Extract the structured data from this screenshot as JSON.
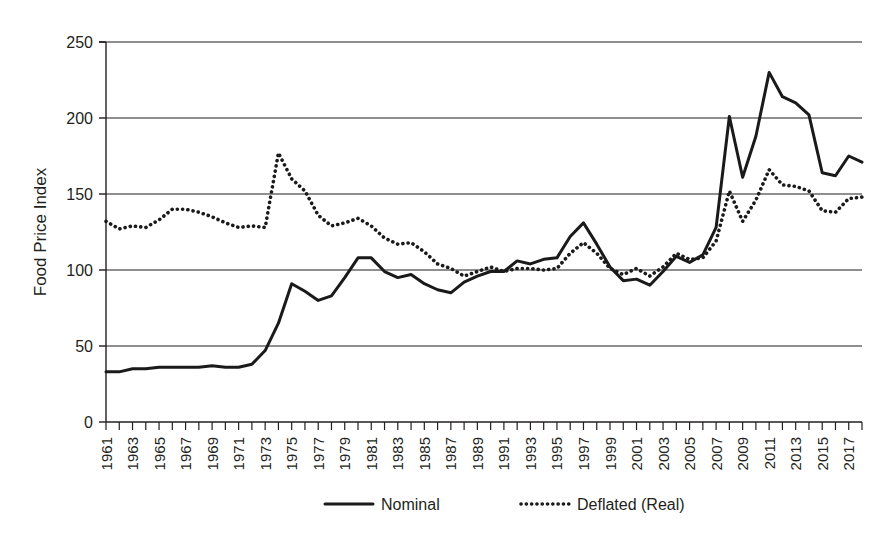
{
  "chart_data": {
    "type": "line",
    "title": "",
    "xlabel": "",
    "ylabel": "Food Price Index",
    "ylim": [
      0,
      250
    ],
    "ytick_step": 50,
    "yticks": [
      "0",
      "50",
      "100",
      "150",
      "200",
      "250"
    ],
    "xlim": [
      1961,
      2018
    ],
    "xtick_step": 1,
    "xtick_label_step": 2,
    "xticks": [
      "1961",
      "1963",
      "1965",
      "1967",
      "1969",
      "1971",
      "1973",
      "1975",
      "1977",
      "1979",
      "1981",
      "1983",
      "1985",
      "1987",
      "1989",
      "1991",
      "1993",
      "1995",
      "1997",
      "1999",
      "2001",
      "2003",
      "2005",
      "2007",
      "2009",
      "2011",
      "2013",
      "2015",
      "2017"
    ],
    "grid": "horizontal",
    "legend_position": "bottom-center",
    "x": [
      1961,
      1962,
      1963,
      1964,
      1965,
      1966,
      1967,
      1968,
      1969,
      1970,
      1971,
      1972,
      1973,
      1974,
      1975,
      1976,
      1977,
      1978,
      1979,
      1980,
      1981,
      1982,
      1983,
      1984,
      1985,
      1986,
      1987,
      1988,
      1989,
      1990,
      1991,
      1992,
      1993,
      1994,
      1995,
      1996,
      1997,
      1998,
      1999,
      2000,
      2001,
      2002,
      2003,
      2004,
      2005,
      2006,
      2007,
      2008,
      2009,
      2010,
      2011,
      2012,
      2013,
      2014,
      2015,
      2016,
      2017,
      2018
    ],
    "series": [
      {
        "name": "Nominal",
        "style": "solid",
        "color": "#1a1a1a",
        "values": [
          33,
          33,
          35,
          35,
          36,
          36,
          36,
          36,
          37,
          36,
          36,
          38,
          47,
          65,
          91,
          86,
          80,
          83,
          95,
          108,
          108,
          99,
          95,
          97,
          91,
          87,
          85,
          92,
          96,
          99,
          99,
          106,
          104,
          107,
          108,
          122,
          131,
          117,
          102,
          93,
          94,
          90,
          99,
          109,
          105,
          110,
          128,
          201,
          161,
          188,
          230,
          214,
          210,
          202,
          164,
          162,
          175,
          171
        ]
      },
      {
        "name": "Deflated (Real)",
        "style": "dotted",
        "color": "#1a1a1a",
        "values": [
          132,
          127,
          129,
          128,
          133,
          140,
          140,
          138,
          135,
          131,
          128,
          129,
          128,
          177,
          160,
          152,
          136,
          129,
          131,
          134,
          129,
          121,
          117,
          118,
          112,
          104,
          101,
          96,
          99,
          102,
          99,
          101,
          101,
          100,
          101,
          111,
          118,
          111,
          101,
          97,
          101,
          96,
          102,
          111,
          107,
          108,
          119,
          152,
          132,
          146,
          166,
          156,
          155,
          152,
          139,
          138,
          147,
          148
        ]
      }
    ],
    "legend": [
      {
        "label": "Nominal",
        "style": "solid"
      },
      {
        "label": "Deflated (Real)",
        "style": "dotted"
      }
    ]
  }
}
